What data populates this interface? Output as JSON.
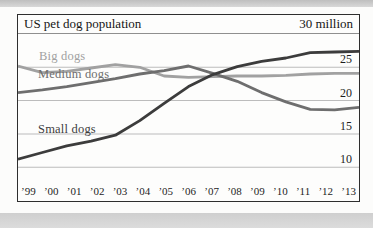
{
  "chart_data": {
    "type": "line",
    "title": "US pet dog population",
    "unit_label": "30 million",
    "x": [
      "’99",
      "’00",
      "’01",
      "’02",
      "’03",
      "’04",
      "’05",
      "’06",
      "’07",
      "’08",
      "’09",
      "’10",
      "’11",
      "’12",
      "’13"
    ],
    "yticks": [
      {
        "label": "25",
        "value": 25
      },
      {
        "label": "20",
        "value": 20
      },
      {
        "label": "15",
        "value": 15
      },
      {
        "label": "10",
        "value": 10
      }
    ],
    "ylim": [
      10,
      30
    ],
    "grid": true,
    "legend_position": "inline-labels",
    "series": [
      {
        "name": "Big dogs",
        "color": "#a1a1a1",
        "values": [
          25.2,
          24.2,
          24.4,
          24.9,
          25.4,
          25.0,
          23.7,
          23.5,
          23.6,
          23.7,
          23.7,
          23.8,
          24.0,
          24.1,
          24.1
        ]
      },
      {
        "name": "Medium dogs",
        "color": "#6e6e6e",
        "values": [
          21.2,
          21.6,
          22.1,
          22.7,
          23.3,
          24.0,
          24.5,
          25.2,
          24.1,
          22.9,
          21.2,
          19.8,
          18.7,
          18.6,
          19.0
        ]
      },
      {
        "name": "Small dogs",
        "color": "#3c3c3c",
        "values": [
          11.2,
          12.2,
          13.2,
          13.9,
          14.8,
          17.0,
          19.6,
          22.1,
          23.9,
          25.1,
          25.9,
          26.4,
          27.2,
          27.3,
          27.4
        ]
      }
    ],
    "colors": {
      "grid": "#bcbcbc",
      "frame": "#2e2e2e",
      "text": "#1d1d1d"
    }
  }
}
